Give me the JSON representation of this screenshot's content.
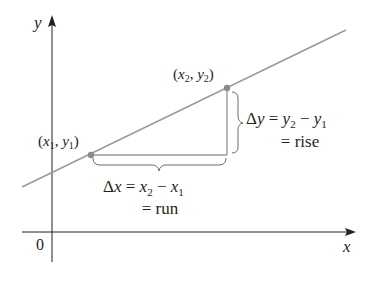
{
  "diagram": {
    "axes": {
      "x_label": "x",
      "y_label": "y",
      "origin_label": "0"
    },
    "points": [
      {
        "id": "p1",
        "label_open": "(",
        "x_var": "x",
        "x_sub": "1",
        "sep": ", ",
        "y_var": "y",
        "y_sub": "1",
        "label_close": ")"
      },
      {
        "id": "p2",
        "label_open": "(",
        "x_var": "x",
        "x_sub": "2",
        "sep": ", ",
        "y_var": "y",
        "y_sub": "2",
        "label_close": ")"
      }
    ],
    "run": {
      "delta": "Δ",
      "var": "x",
      "eq": " = ",
      "a": "x",
      "a_sub": "2",
      "minus": " − ",
      "b": "x",
      "b_sub": "1",
      "line2": "= run"
    },
    "rise": {
      "delta": "Δ",
      "var": "y",
      "eq": " = ",
      "a": "y",
      "a_sub": "2",
      "minus": " − ",
      "b": "y",
      "b_sub": "1",
      "line2": "= rise"
    },
    "colors": {
      "line": "#9a9a9a",
      "segment": "#9a9a9a",
      "point": "#8a8a8a",
      "axis": "#231f20",
      "brace": "#6d6d6d",
      "text": "#231f20"
    }
  }
}
